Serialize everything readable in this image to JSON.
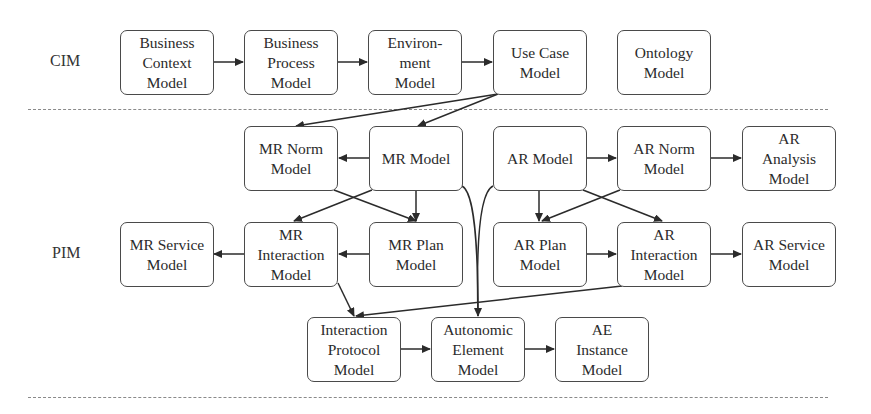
{
  "layers": [
    {
      "id": "cim",
      "label": "CIM"
    },
    {
      "id": "pim",
      "label": "PIM"
    }
  ],
  "nodes": {
    "business_context": {
      "label": "Business\nContext\nModel"
    },
    "business_process": {
      "label": "Business\nProcess\nModel"
    },
    "environment": {
      "label": "Environ-\nment\nModel"
    },
    "use_case": {
      "label": "Use Case\nModel"
    },
    "ontology": {
      "label": "Ontology\nModel"
    },
    "mr_norm": {
      "label": "MR Norm\nModel"
    },
    "mr_model": {
      "label": "MR Model"
    },
    "ar_model": {
      "label": "AR Model"
    },
    "ar_norm": {
      "label": "AR Norm\nModel"
    },
    "ar_analysis": {
      "label": "AR\nAnalysis\nModel"
    },
    "mr_service": {
      "label": "MR Service\nModel"
    },
    "mr_interaction": {
      "label": "MR\nInteraction\nModel"
    },
    "mr_plan": {
      "label": "MR Plan\nModel"
    },
    "ar_plan": {
      "label": "AR Plan\nModel"
    },
    "ar_interaction": {
      "label": "AR\nInteraction\nModel"
    },
    "ar_service": {
      "label": "AR Service\nModel"
    },
    "interaction_protocol": {
      "label": "Interaction\nProtocol\nModel"
    },
    "autonomic_element": {
      "label": "Autonomic\nElement\nModel"
    },
    "ae_instance": {
      "label": "AE\nInstance\nModel"
    }
  },
  "edges": [
    [
      "business_context",
      "business_process"
    ],
    [
      "business_process",
      "environment"
    ],
    [
      "environment",
      "use_case"
    ],
    [
      "use_case",
      "mr_norm"
    ],
    [
      "use_case",
      "mr_model"
    ],
    [
      "mr_model",
      "mr_norm"
    ],
    [
      "mr_model",
      "mr_plan"
    ],
    [
      "mr_model",
      "mr_interaction"
    ],
    [
      "mr_norm",
      "mr_plan"
    ],
    [
      "mr_plan",
      "mr_interaction"
    ],
    [
      "mr_interaction",
      "mr_service"
    ],
    [
      "mr_interaction",
      "interaction_protocol"
    ],
    [
      "mr_model",
      "autonomic_element"
    ],
    [
      "ar_model",
      "autonomic_element"
    ],
    [
      "ar_model",
      "ar_norm"
    ],
    [
      "ar_norm",
      "ar_analysis"
    ],
    [
      "ar_model",
      "ar_plan"
    ],
    [
      "ar_model",
      "ar_interaction"
    ],
    [
      "ar_norm",
      "ar_plan"
    ],
    [
      "ar_plan",
      "ar_interaction"
    ],
    [
      "ar_interaction",
      "ar_service"
    ],
    [
      "ar_interaction",
      "interaction_protocol"
    ],
    [
      "interaction_protocol",
      "autonomic_element"
    ],
    [
      "autonomic_element",
      "ae_instance"
    ]
  ]
}
